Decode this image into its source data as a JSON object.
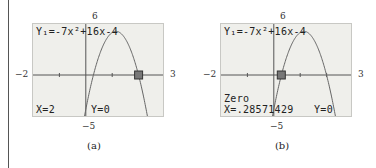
{
  "panels": [
    {
      "id": "a",
      "caption": "(a)",
      "equation": "Y₁=-7x²+16x-4",
      "status_line_1": "",
      "x_readout": "X=2",
      "y_readout": "Y=0",
      "ymax_label": "6",
      "ymin_label": "−5",
      "xmin_label": "−2",
      "xmax_label": "3",
      "cursor_x": 2
    },
    {
      "id": "b",
      "caption": "(b)",
      "equation": "Y₁=-7x²+16x-4",
      "status_line_1": "Zero",
      "x_readout": "X=.28571429",
      "y_readout": "Y=0",
      "ymax_label": "6",
      "ymin_label": "−5",
      "xmin_label": "−2",
      "xmax_label": "3",
      "cursor_x": 0.28571429
    }
  ],
  "chart_data": [
    {
      "type": "line",
      "title": "(a)",
      "function": "y = -7x^2 + 16x - 4",
      "xlim": [
        -2,
        3
      ],
      "ylim": [
        -5,
        6
      ],
      "grid": false,
      "highlighted_point": {
        "x": 2,
        "y": 0
      },
      "annotations": [
        "Y1=-7x^2+16x-4",
        "X=2",
        "Y=0"
      ]
    },
    {
      "type": "line",
      "title": "(b)",
      "function": "y = -7x^2 + 16x - 4",
      "xlim": [
        -2,
        3
      ],
      "ylim": [
        -5,
        6
      ],
      "grid": false,
      "highlighted_point": {
        "x": 0.28571429,
        "y": 0
      },
      "annotations": [
        "Y1=-7x^2+16x-4",
        "Zero",
        "X=.28571429",
        "Y=0"
      ]
    }
  ]
}
